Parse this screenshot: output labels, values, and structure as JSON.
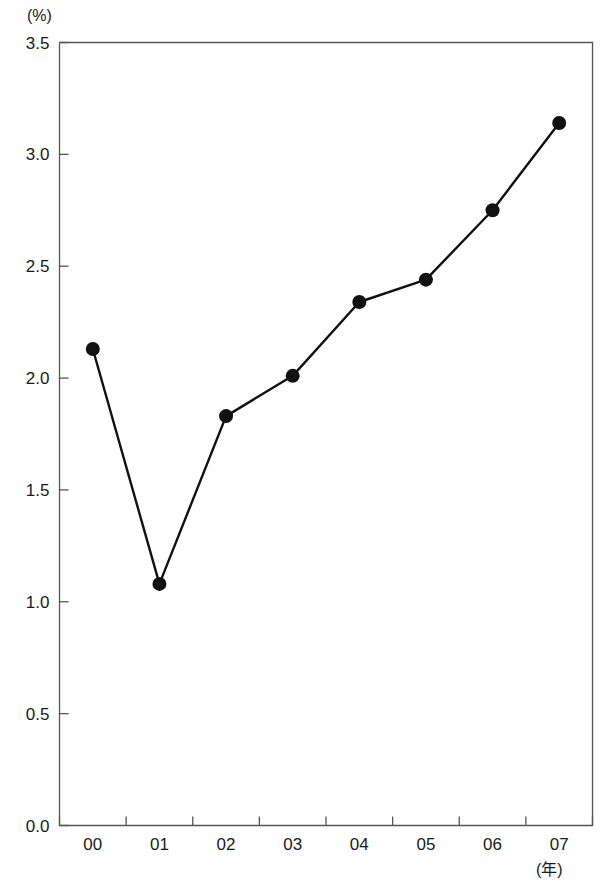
{
  "chart_data": {
    "type": "line",
    "title": "",
    "xlabel": "(年)",
    "ylabel": "(%)",
    "categories": [
      "00",
      "01",
      "02",
      "03",
      "04",
      "05",
      "06",
      "07"
    ],
    "values": [
      2.13,
      1.08,
      1.83,
      2.01,
      2.34,
      2.44,
      2.75,
      3.14
    ],
    "series": [
      {
        "name": "",
        "values": [
          2.13,
          1.08,
          1.83,
          2.01,
          2.34,
          2.44,
          2.75,
          3.14
        ]
      }
    ],
    "ylim": [
      0.0,
      3.5
    ],
    "y_ticks": [
      "0.0",
      "0.5",
      "1.0",
      "1.5",
      "2.0",
      "2.5",
      "3.0",
      "3.5"
    ],
    "y_tick_values": [
      0.0,
      0.5,
      1.0,
      1.5,
      2.0,
      2.5,
      3.0,
      3.5
    ],
    "x_tick_labels": [
      "00",
      "01",
      "02",
      "03",
      "04",
      "05",
      "06",
      "07"
    ],
    "grid": false,
    "legend": "none",
    "marker": "filled-circle",
    "line_color": "#111111",
    "marker_color": "#111111",
    "axis_color": "#555555"
  },
  "axis": {
    "y_unit": "(%)",
    "x_unit": "(年)"
  }
}
